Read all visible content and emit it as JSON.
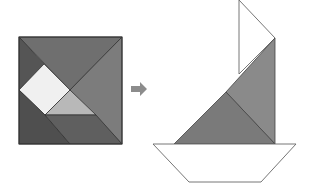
{
  "diagram": {
    "type": "tangram-transformation",
    "colors": {
      "background": "#ffffff",
      "dark": "#5a5a5a",
      "darker": "#4f4f4f",
      "medium": "#7c7c7c",
      "medium_light": "#8a8a8a",
      "light": "#b8b8b8",
      "lightest": "#f0f0f0",
      "stroke": "#333333",
      "outline": "#666666",
      "arrow": "#8c8c8c"
    },
    "square": {
      "label": "tangram-square",
      "bounds": [
        19,
        37,
        122,
        144
      ]
    },
    "arrow": {
      "icon": "right-arrow-icon",
      "direction": "right"
    },
    "sailboat": {
      "label": "tangram-sailboat",
      "parts": [
        "white-sail",
        "grey-sail-large",
        "grey-sail-small",
        "hull"
      ]
    }
  }
}
